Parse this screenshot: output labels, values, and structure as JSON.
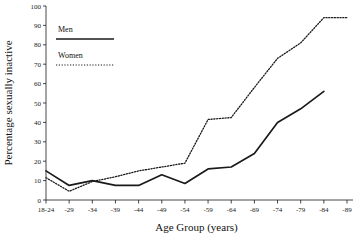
{
  "chart_data": {
    "type": "line",
    "title": "",
    "xlabel": "Age Group (years)",
    "ylabel": "Percentage sexually inactive",
    "categories": [
      "18-24",
      "-29",
      "-34",
      "-39",
      "-44",
      "-49",
      "-54",
      "-59",
      "-64",
      "-69",
      "-74",
      "-79",
      "-84",
      "-89"
    ],
    "yticks": [
      0,
      10,
      20,
      30,
      40,
      50,
      60,
      70,
      80,
      90,
      100
    ],
    "ylim": [
      0,
      100
    ],
    "grid": false,
    "legend_position": "upper-left",
    "series": [
      {
        "name": "Men",
        "style": "solid",
        "color": "#1a1a1a",
        "values": [
          15,
          7.5,
          10,
          7.5,
          7.5,
          13,
          8.5,
          16,
          17,
          24,
          40,
          47,
          56,
          null
        ]
      },
      {
        "name": "Women",
        "style": "dotted",
        "color": "#1a1a1a",
        "values": [
          11.5,
          4.5,
          9.5,
          12,
          15,
          17,
          19,
          41.5,
          42.5,
          58,
          73,
          81,
          94,
          94
        ]
      }
    ]
  },
  "legend": {
    "men_label": "Men",
    "women_label": "Women"
  },
  "axes": {
    "x_title": "Age Group (years)",
    "y_title": "Percentage sexually inactive"
  }
}
